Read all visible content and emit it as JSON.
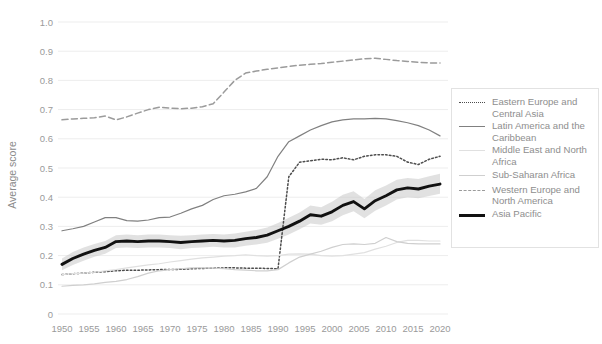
{
  "figure": {
    "clipped_title": "",
    "background_color": "#ffffff"
  },
  "axes": {
    "ylabel": "Average score",
    "xlabel": ""
  },
  "legend": {
    "position": "right",
    "items": [
      {
        "label": "Eastern Europe and Central Asia",
        "style": "dotted",
        "color": "#4d4d4d",
        "swatch_class": "sw-dotted"
      },
      {
        "label": "Latin America and the Caribbean",
        "style": "solid",
        "color": "#808080",
        "swatch_class": "sw-solid-med"
      },
      {
        "label": "Middle East and North Africa",
        "style": "solid",
        "color": "#e0e0e0",
        "swatch_class": "sw-solid-xlight"
      },
      {
        "label": "Sub-Saharan Africa",
        "style": "solid",
        "color": "#cfcfcf",
        "swatch_class": "sw-solid-light"
      },
      {
        "label": "Western Europe and North America",
        "style": "dashed",
        "color": "#9b9b9b",
        "swatch_class": "sw-dashed"
      },
      {
        "label": "Asia Pacific",
        "style": "solid-thick",
        "color": "#111111",
        "swatch_class": "sw-thick"
      }
    ]
  },
  "chart_data": {
    "type": "line",
    "title": "",
    "xlabel": "",
    "ylabel": "Average score",
    "xlim": [
      1950,
      2020
    ],
    "ylim": [
      0.0,
      1.0
    ],
    "ytick_labels": [
      "0",
      "0.1",
      "0.2",
      "0.3",
      "0.4",
      "0.5",
      "0.6",
      "0.7",
      "0.8",
      "0.9",
      "1.0"
    ],
    "ytick_values": [
      0.0,
      0.1,
      0.2,
      0.3,
      0.4,
      0.5,
      0.6,
      0.7,
      0.8,
      0.9,
      1.0
    ],
    "xtick_labels": [
      "1950",
      "1955",
      "1960",
      "1965",
      "1970",
      "1975",
      "1980",
      "1985",
      "1990",
      "1995",
      "2000",
      "2005",
      "2010",
      "2015",
      "2020"
    ],
    "xtick_values": [
      1950,
      1955,
      1960,
      1965,
      1970,
      1975,
      1980,
      1985,
      1990,
      1995,
      2000,
      2005,
      2010,
      2015,
      2020
    ],
    "grid": "horizontal",
    "legend_position": "right",
    "x": [
      1950,
      1952,
      1954,
      1956,
      1958,
      1960,
      1962,
      1964,
      1966,
      1968,
      1970,
      1972,
      1974,
      1976,
      1978,
      1980,
      1982,
      1984,
      1986,
      1988,
      1990,
      1992,
      1994,
      1996,
      1998,
      2000,
      2002,
      2004,
      2006,
      2008,
      2010,
      2012,
      2014,
      2016,
      2018,
      2020
    ],
    "series": [
      {
        "name": "Eastern Europe and Central Asia",
        "style": "dotted",
        "color": "#4d4d4d",
        "values": [
          0.135,
          0.138,
          0.14,
          0.143,
          0.145,
          0.148,
          0.15,
          0.15,
          0.151,
          0.152,
          0.152,
          0.153,
          0.155,
          0.156,
          0.157,
          0.158,
          0.158,
          0.157,
          0.157,
          0.156,
          0.155,
          0.47,
          0.52,
          0.525,
          0.53,
          0.528,
          0.535,
          0.528,
          0.54,
          0.545,
          0.545,
          0.54,
          0.52,
          0.512,
          0.53,
          0.54
        ]
      },
      {
        "name": "Latin America and the Caribbean",
        "style": "solid",
        "color": "#808080",
        "values": [
          0.285,
          0.292,
          0.3,
          0.315,
          0.33,
          0.33,
          0.32,
          0.318,
          0.322,
          0.33,
          0.332,
          0.345,
          0.36,
          0.372,
          0.392,
          0.405,
          0.41,
          0.418,
          0.43,
          0.47,
          0.54,
          0.59,
          0.61,
          0.63,
          0.645,
          0.658,
          0.665,
          0.668,
          0.668,
          0.67,
          0.668,
          0.662,
          0.655,
          0.645,
          0.63,
          0.61
        ]
      },
      {
        "name": "Middle East and North Africa",
        "style": "solid",
        "color": "#e0e0e0",
        "values": [
          0.135,
          0.138,
          0.14,
          0.143,
          0.148,
          0.152,
          0.158,
          0.163,
          0.168,
          0.172,
          0.178,
          0.183,
          0.188,
          0.192,
          0.195,
          0.198,
          0.2,
          0.203,
          0.2,
          0.198,
          0.2,
          0.205,
          0.206,
          0.205,
          0.2,
          0.198,
          0.2,
          0.205,
          0.21,
          0.222,
          0.232,
          0.245,
          0.252,
          0.252,
          0.25,
          0.25
        ]
      },
      {
        "name": "Sub-Saharan Africa",
        "style": "solid",
        "color": "#cfcfcf",
        "values": [
          0.095,
          0.098,
          0.1,
          0.103,
          0.108,
          0.112,
          0.118,
          0.128,
          0.14,
          0.148,
          0.152,
          0.155,
          0.158,
          0.158,
          0.157,
          0.155,
          0.152,
          0.15,
          0.148,
          0.148,
          0.152,
          0.175,
          0.195,
          0.205,
          0.215,
          0.228,
          0.238,
          0.24,
          0.238,
          0.242,
          0.262,
          0.248,
          0.242,
          0.24,
          0.24,
          0.24
        ]
      },
      {
        "name": "Western Europe and North America",
        "style": "dashed",
        "color": "#9b9b9b",
        "values": [
          0.665,
          0.668,
          0.67,
          0.672,
          0.678,
          0.665,
          0.675,
          0.688,
          0.7,
          0.708,
          0.705,
          0.703,
          0.705,
          0.71,
          0.72,
          0.76,
          0.8,
          0.825,
          0.832,
          0.838,
          0.843,
          0.848,
          0.852,
          0.855,
          0.858,
          0.862,
          0.866,
          0.87,
          0.874,
          0.876,
          0.872,
          0.868,
          0.865,
          0.862,
          0.86,
          0.86
        ]
      },
      {
        "name": "Asia Pacific",
        "style": "solid-thick",
        "color": "#111111",
        "values": [
          0.17,
          0.19,
          0.205,
          0.218,
          0.228,
          0.248,
          0.25,
          0.248,
          0.25,
          0.25,
          0.248,
          0.245,
          0.248,
          0.25,
          0.252,
          0.25,
          0.252,
          0.258,
          0.262,
          0.27,
          0.285,
          0.3,
          0.318,
          0.34,
          0.335,
          0.35,
          0.372,
          0.385,
          0.36,
          0.388,
          0.405,
          0.425,
          0.432,
          0.428,
          0.438,
          0.445
        ]
      }
    ],
    "confidence_band": {
      "series": "Asia Pacific",
      "color": "#c9c9c9",
      "lower": [
        0.15,
        0.168,
        0.182,
        0.196,
        0.206,
        0.226,
        0.228,
        0.226,
        0.228,
        0.228,
        0.226,
        0.222,
        0.226,
        0.228,
        0.23,
        0.228,
        0.228,
        0.234,
        0.238,
        0.244,
        0.258,
        0.272,
        0.29,
        0.31,
        0.306,
        0.318,
        0.338,
        0.352,
        0.328,
        0.354,
        0.372,
        0.392,
        0.4,
        0.396,
        0.404,
        0.412
      ],
      "upper": [
        0.19,
        0.212,
        0.228,
        0.24,
        0.25,
        0.27,
        0.272,
        0.27,
        0.272,
        0.272,
        0.27,
        0.268,
        0.27,
        0.272,
        0.274,
        0.272,
        0.276,
        0.282,
        0.288,
        0.296,
        0.312,
        0.33,
        0.348,
        0.372,
        0.366,
        0.384,
        0.408,
        0.42,
        0.394,
        0.424,
        0.44,
        0.46,
        0.466,
        0.462,
        0.472,
        0.48
      ]
    }
  }
}
